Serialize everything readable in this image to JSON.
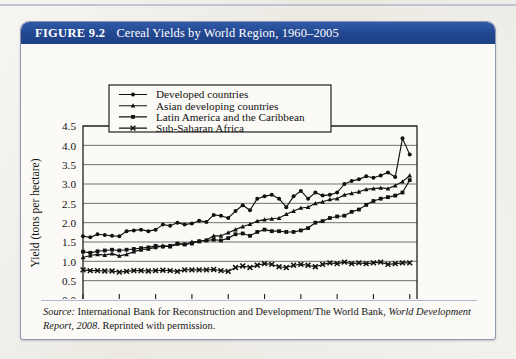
{
  "figure": {
    "number": "FIGURE 9.2",
    "title": "Cereal Yields by World Region, 1960–2005"
  },
  "source": {
    "label": "Source:",
    "text_part1": " International Bank for Reconstruction and Development/The World Bank, ",
    "italic_part": "World Development Report, 2008",
    "text_part2": ". Reprinted with permission."
  },
  "chart_data": {
    "type": "line",
    "title": "Cereal Yields by World Region, 1960–2005",
    "xlabel": "Year",
    "ylabel": "Yield (tons per hectare)",
    "xlim": [
      1960,
      2006
    ],
    "ylim": [
      0.0,
      4.5
    ],
    "xticks": [
      1960,
      1965,
      1970,
      1975,
      1980,
      1985,
      1990,
      1995,
      2000,
      2005
    ],
    "yticks": [
      0.0,
      0.5,
      1.0,
      1.5,
      2.0,
      2.5,
      3.0,
      3.5,
      4.0,
      4.5
    ],
    "ytick_labels": [
      "0.0",
      "0.5",
      "1.0",
      "1.5",
      "2.0",
      "2.5",
      "3.0",
      "3.5",
      "4.0",
      "4.5"
    ],
    "grid": "horizontal",
    "legend_position": "top-center",
    "x": [
      1960,
      1961,
      1962,
      1963,
      1964,
      1965,
      1966,
      1967,
      1968,
      1969,
      1970,
      1971,
      1972,
      1973,
      1974,
      1975,
      1976,
      1977,
      1978,
      1979,
      1980,
      1981,
      1982,
      1983,
      1984,
      1985,
      1986,
      1987,
      1988,
      1989,
      1990,
      1991,
      1992,
      1993,
      1994,
      1995,
      1996,
      1997,
      1998,
      1999,
      2000,
      2001,
      2002,
      2003,
      2004,
      2005
    ],
    "series": [
      {
        "name": "Developed countries",
        "marker": "circle",
        "values": [
          1.65,
          1.62,
          1.7,
          1.68,
          1.66,
          1.65,
          1.78,
          1.8,
          1.82,
          1.78,
          1.82,
          1.95,
          1.92,
          2.0,
          1.95,
          1.98,
          2.05,
          2.02,
          2.2,
          2.18,
          2.12,
          2.3,
          2.45,
          2.32,
          2.62,
          2.68,
          2.72,
          2.62,
          2.4,
          2.68,
          2.82,
          2.62,
          2.78,
          2.7,
          2.72,
          2.78,
          3.0,
          3.08,
          3.12,
          3.2,
          3.16,
          3.22,
          3.3,
          3.18,
          4.18,
          3.76
        ]
      },
      {
        "name": "Asian developing countries",
        "marker": "triangle",
        "values": [
          1.1,
          1.15,
          1.18,
          1.16,
          1.2,
          1.14,
          1.18,
          1.25,
          1.3,
          1.32,
          1.36,
          1.4,
          1.38,
          1.45,
          1.44,
          1.5,
          1.52,
          1.55,
          1.66,
          1.66,
          1.74,
          1.82,
          1.9,
          1.96,
          2.04,
          2.08,
          2.1,
          2.12,
          2.22,
          2.3,
          2.38,
          2.4,
          2.5,
          2.54,
          2.6,
          2.62,
          2.72,
          2.76,
          2.8,
          2.86,
          2.88,
          2.9,
          2.88,
          2.96,
          3.06,
          3.22
        ]
      },
      {
        "name": "Latin America and the Caribbean",
        "marker": "square",
        "values": [
          1.25,
          1.22,
          1.26,
          1.28,
          1.3,
          1.28,
          1.3,
          1.32,
          1.34,
          1.36,
          1.4,
          1.38,
          1.4,
          1.46,
          1.44,
          1.46,
          1.52,
          1.54,
          1.56,
          1.54,
          1.6,
          1.7,
          1.72,
          1.66,
          1.76,
          1.82,
          1.78,
          1.78,
          1.76,
          1.76,
          1.8,
          1.86,
          2.0,
          2.04,
          2.12,
          2.16,
          2.18,
          2.28,
          2.34,
          2.46,
          2.56,
          2.62,
          2.66,
          2.7,
          2.78,
          3.1
        ]
      },
      {
        "name": "Sub-Saharan Africa",
        "marker": "cross",
        "values": [
          0.78,
          0.76,
          0.76,
          0.75,
          0.75,
          0.72,
          0.74,
          0.76,
          0.76,
          0.75,
          0.76,
          0.77,
          0.76,
          0.74,
          0.78,
          0.78,
          0.78,
          0.78,
          0.79,
          0.76,
          0.74,
          0.84,
          0.88,
          0.84,
          0.9,
          0.94,
          0.92,
          0.86,
          0.84,
          0.9,
          0.92,
          0.9,
          0.86,
          0.92,
          0.96,
          0.94,
          0.98,
          0.94,
          0.96,
          0.94,
          0.96,
          0.98,
          0.92,
          0.94,
          0.96,
          0.96
        ]
      }
    ]
  }
}
